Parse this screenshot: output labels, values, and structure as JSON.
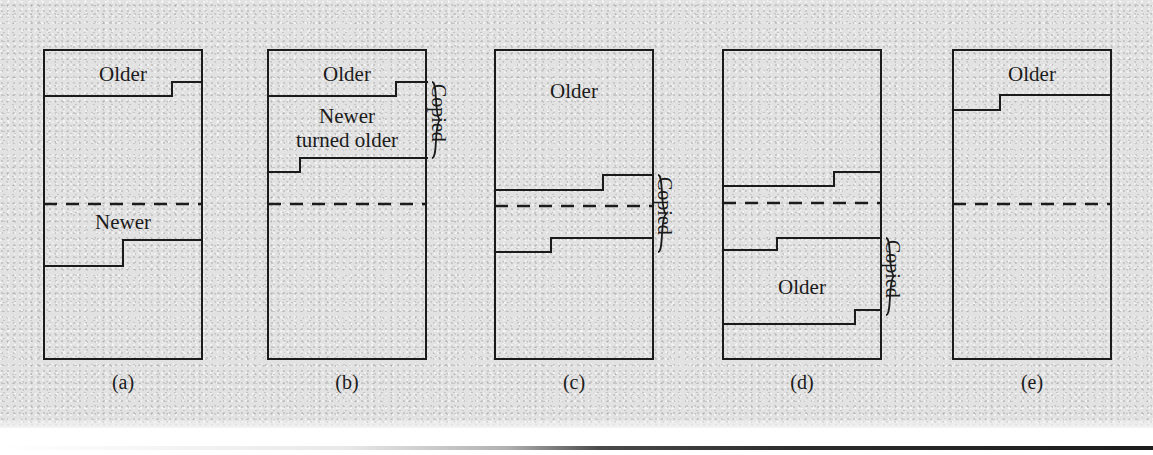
{
  "figure": {
    "type": "diagram",
    "background_color": "#e2e2e2",
    "line_color": "#1b1b1b"
  },
  "panels": [
    {
      "id": "a",
      "label": "(a)",
      "regions": [
        {
          "name": "older",
          "text": "Older",
          "x": 123,
          "y": 63
        },
        {
          "name": "newer",
          "text": "Newer",
          "x": 123,
          "y": 211
        }
      ],
      "steps": [
        {
          "name": "older-boundary",
          "points": "43,96 172,96 172,82 203,82"
        },
        {
          "name": "newer-boundary",
          "points": "43,266 123,266 123,240 203,240"
        }
      ],
      "midline_y": 204,
      "brace": null
    },
    {
      "id": "b",
      "label": "(b)",
      "regions": [
        {
          "name": "older",
          "text": "Older",
          "x": 347,
          "y": 63
        },
        {
          "name": "newer-turned-older",
          "text": "Newer\nturned older",
          "x": 347,
          "y": 105
        }
      ],
      "steps": [
        {
          "name": "older-boundary",
          "points": "267,96 396,96 396,82 428,82"
        },
        {
          "name": "newer-turned-older-boundary",
          "points": "267,172 300,172 300,158 428,158"
        }
      ],
      "midline_y": 204,
      "brace": {
        "name": "copied-brace",
        "label": "Copied",
        "top": 82,
        "bottom": 158,
        "x": 434
      }
    },
    {
      "id": "c",
      "label": "(c)",
      "regions": [
        {
          "name": "older",
          "text": "Older",
          "x": 574,
          "y": 80
        }
      ],
      "steps": [
        {
          "name": "upper-boundary",
          "points": "494,190 603,190 603,175 654,175"
        },
        {
          "name": "lower-boundary",
          "points": "494,252 551,252 551,238 654,238"
        }
      ],
      "midline_y": 206,
      "brace": {
        "name": "copied-brace",
        "label": "Copied",
        "top": 175,
        "bottom": 252,
        "x": 660
      }
    },
    {
      "id": "d",
      "label": "(d)",
      "regions": [
        {
          "name": "older",
          "text": "Older",
          "x": 802,
          "y": 276
        }
      ],
      "steps": [
        {
          "name": "upper-boundary",
          "points": "722,186 834,186 834,172 882,172"
        },
        {
          "name": "middle-boundary",
          "points": "722,250 777,250 777,238 882,238"
        },
        {
          "name": "lower-boundary",
          "points": "722,324 855,324 855,310 882,310"
        }
      ],
      "midline_y": 203,
      "brace": {
        "name": "copied-brace",
        "label": "Copied",
        "top": 238,
        "bottom": 315,
        "x": 888
      }
    },
    {
      "id": "e",
      "label": "(e)",
      "regions": [
        {
          "name": "older",
          "text": "Older",
          "x": 1032,
          "y": 63
        }
      ],
      "steps": [
        {
          "name": "older-boundary",
          "points": "952,110 1000,110 1000,95 1112,95"
        }
      ],
      "midline_y": 204,
      "brace": null
    }
  ]
}
